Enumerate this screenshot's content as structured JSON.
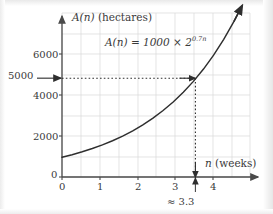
{
  "figure": {
    "background_color": "#ffffff",
    "ink_color": "#3a3a3a",
    "grid_color": "#d8d8d8"
  },
  "labels": {
    "y_axis_title_fn": "A(n)",
    "y_axis_title_unit": "(hectares)",
    "x_axis_title_fn": "n",
    "x_axis_title_unit": "(weeks)",
    "formula_lhs": "A(n) = 1000 ",
    "formula_times": "×",
    "formula_base": " 2",
    "formula_exponent": "0.7n",
    "solution_annotation": "≈ 3.3"
  },
  "chart_data": {
    "type": "line",
    "title": "",
    "xlabel": "n (weeks)",
    "ylabel": "A(n) (hectares)",
    "function": "A(n) = 1000 × 2^(0.7n)",
    "xlim": [
      0,
      4.65
    ],
    "ylim": [
      0,
      8300
    ],
    "grid": true,
    "grid_x_step": 0.5,
    "grid_y_step": 1000,
    "legend": "none",
    "x_ticks": [
      0,
      1,
      2,
      3,
      4
    ],
    "x_tick_labels": [
      "0",
      "1",
      "2",
      "3",
      "4"
    ],
    "y_ticks": [
      0,
      2000,
      4000,
      5000,
      6000
    ],
    "y_tick_labels": [
      "0",
      "2000",
      "4000",
      "5000",
      "6000"
    ],
    "x": [
      0,
      0.25,
      0.5,
      0.75,
      1,
      1.25,
      1.5,
      1.75,
      2,
      2.25,
      2.5,
      2.75,
      3,
      3.25,
      3.5,
      3.75,
      4,
      4.25,
      4.45
    ],
    "y": [
      1000,
      1129,
      1275,
      1440,
      1625,
      1834,
      2071,
      2338,
      2639,
      2979,
      3364,
      3797,
      4287,
      4839,
      5463,
      6167,
      6964,
      7861,
      8650
    ],
    "annotations": [
      {
        "name": "solution-readoff",
        "text": "≈ 3.3",
        "x": 3.3,
        "y": 5000,
        "guide_from_y_axis": true,
        "guide_to_x_axis": true
      }
    ],
    "markers": [
      {
        "name": "arrow-into-curve",
        "at_y": 5000,
        "direction": "right"
      },
      {
        "name": "arrow-down-to-axis",
        "at_x": 3.3,
        "direction": "down"
      },
      {
        "name": "arrow-up-tick",
        "at_x": 3.3,
        "direction": "up"
      }
    ]
  }
}
